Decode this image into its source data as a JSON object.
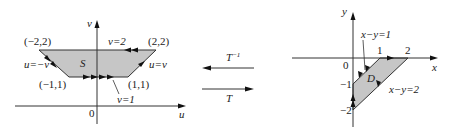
{
  "figure": {
    "left_panel": {
      "axis_labels": {
        "horizontal": "u",
        "vertical": "v"
      },
      "origin_label": "0",
      "region_label": "S",
      "region_vertices": [
        [
          -2,
          2
        ],
        [
          2,
          2
        ],
        [
          1,
          1
        ],
        [
          -1,
          1
        ]
      ],
      "vertex_labels": [
        "(−2,2)",
        "(2,2)",
        "(−1,1)",
        "(1,1)"
      ],
      "boundary_labels": {
        "top": "v=2",
        "bottom": "v=1",
        "left": "u=−v",
        "right": "u=v"
      }
    },
    "transform_arrows": {
      "inverse_label": "T",
      "inverse_sup": "−1",
      "forward_label": "T"
    },
    "right_panel": {
      "axis_labels": {
        "horizontal": "x",
        "vertical": "y"
      },
      "origin_label": "0",
      "region_label": "D",
      "region_vertices": [
        [
          1,
          0
        ],
        [
          2,
          0
        ],
        [
          0,
          -2
        ],
        [
          0,
          -1
        ]
      ],
      "tick_labels": {
        "x1": "1",
        "x2": "2",
        "y1": "−1",
        "y2": "−2"
      },
      "boundary_labels": {
        "upper_left": "x−y=1",
        "lower_right": "x−y=2"
      }
    },
    "colors": {
      "region_fill": "#c6c6c6",
      "line": "#333333",
      "background": "#ffffff"
    }
  }
}
